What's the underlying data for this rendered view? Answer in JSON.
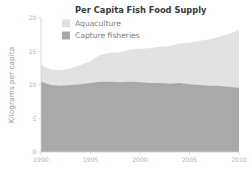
{
  "chart_data": {
    "type": "area",
    "title": "Per Capita Fish Food Supply",
    "xlabel": "",
    "ylabel": "Kilograms per capita",
    "stacked": true,
    "grid": false,
    "legend_position": "top-left",
    "xlim": [
      1990,
      2010
    ],
    "ylim": [
      0,
      20
    ],
    "xticks": [
      1990,
      1995,
      2000,
      2005,
      2010
    ],
    "xtick_labels": [
      "1990",
      "1995",
      "2000",
      "2005",
      "2010"
    ],
    "yticks": [
      0,
      5,
      10,
      15,
      20
    ],
    "ytick_labels": [
      "0",
      "5",
      "10",
      "15",
      "20"
    ],
    "x": [
      1990,
      1991,
      1992,
      1993,
      1994,
      1995,
      1996,
      1997,
      1998,
      1999,
      2000,
      2001,
      2002,
      2003,
      2004,
      2005,
      2006,
      2007,
      2008,
      2009,
      2010
    ],
    "series": [
      {
        "name": "Capture fisheries",
        "color": "#a9a9a9",
        "values": [
          10.5,
          10.0,
          9.9,
          10.0,
          10.1,
          10.3,
          10.5,
          10.5,
          10.4,
          10.5,
          10.4,
          10.3,
          10.3,
          10.2,
          10.3,
          10.1,
          10.0,
          9.9,
          9.9,
          9.7,
          9.6
        ]
      },
      {
        "name": "Aquaculture",
        "color": "#e2e2e2",
        "values": [
          2.5,
          2.3,
          2.3,
          2.5,
          2.9,
          3.3,
          4.0,
          4.3,
          4.5,
          4.8,
          5.0,
          5.2,
          5.4,
          5.6,
          5.9,
          6.2,
          6.6,
          6.9,
          7.3,
          7.9,
          8.6
        ]
      }
    ],
    "totals": [
      13.0,
      12.3,
      12.2,
      12.5,
      13.0,
      13.6,
      14.5,
      14.8,
      14.9,
      15.3,
      15.4,
      15.5,
      15.7,
      15.8,
      16.2,
      16.3,
      16.6,
      16.8,
      17.2,
      17.6,
      18.2
    ]
  },
  "legend": {
    "items": [
      {
        "label": "Aquaculture",
        "color": "#e2e2e2"
      },
      {
        "label": "Capture fisheries",
        "color": "#a9a9a9"
      }
    ]
  },
  "colors": {
    "background": "#ffffff",
    "aquaculture": "#e2e2e2",
    "capture_fisheries": "#a9a9a9",
    "axis": "#d2d2d2",
    "tick_text": "#b4b4b4",
    "title_text": "#3a3a3a",
    "legend_text": "#7d7d7d",
    "axis_title_text": "#9a9a9a"
  }
}
